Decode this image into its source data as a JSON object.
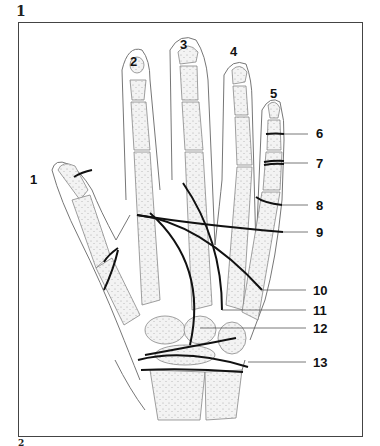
{
  "figure": {
    "number_top": "1",
    "number_bottom": "2"
  },
  "finger_labels": [
    {
      "id": "1",
      "text": "1",
      "x": 30,
      "y": 173
    },
    {
      "id": "2",
      "text": "2",
      "x": 130,
      "y": 55
    },
    {
      "id": "3",
      "text": "3",
      "x": 180,
      "y": 38
    },
    {
      "id": "4",
      "text": "4",
      "x": 230,
      "y": 45
    },
    {
      "id": "5",
      "text": "5",
      "x": 270,
      "y": 87
    }
  ],
  "line_labels": [
    {
      "id": "6",
      "text": "6",
      "x": 316,
      "y": 127
    },
    {
      "id": "7",
      "text": "7",
      "x": 316,
      "y": 159
    },
    {
      "id": "8",
      "text": "8",
      "x": 316,
      "y": 201
    },
    {
      "id": "9",
      "text": "9",
      "x": 316,
      "y": 229
    },
    {
      "id": "10",
      "text": "10",
      "x": 313,
      "y": 285
    },
    {
      "id": "11",
      "text": "11",
      "x": 313,
      "y": 306
    },
    {
      "id": "12",
      "text": "12",
      "x": 313,
      "y": 323
    },
    {
      "id": "13",
      "text": "13",
      "x": 313,
      "y": 355
    }
  ],
  "colors": {
    "outline": "#666666",
    "bone_fill": "#e6e6e6",
    "cut_line": "#111111",
    "leader": "#555555"
  }
}
